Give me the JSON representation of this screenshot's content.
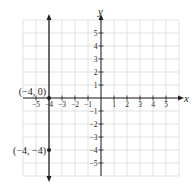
{
  "chart_data": {
    "type": "line",
    "title": "",
    "xlabel": "x",
    "ylabel": "y",
    "xlim": [
      -6,
      6
    ],
    "ylim": [
      -6,
      6
    ],
    "grid": true,
    "x_ticks": [
      -5,
      -4,
      -3,
      -2,
      -1,
      1,
      2,
      3,
      4,
      5
    ],
    "y_ticks": [
      5,
      4,
      3,
      2,
      1,
      -1,
      -2,
      -3,
      -4,
      -5
    ],
    "x_tick_labels": [
      "−5",
      "−4",
      "−3",
      "−2",
      "−1",
      "1",
      "2",
      "3",
      "4",
      "5"
    ],
    "y_tick_labels": [
      "5",
      "4",
      "3",
      "2",
      "1",
      "−1",
      "−2",
      "−3",
      "−4",
      "−5"
    ],
    "series": [
      {
        "name": "x = -4",
        "kind": "vertical-line",
        "x": -4,
        "arrows": "both",
        "points": [
          {
            "x": -4,
            "y": 0,
            "label": "(−4, 0)"
          },
          {
            "x": -4,
            "y": -4,
            "label": "(−4, −4)"
          }
        ]
      }
    ]
  },
  "axes": {
    "x_label": "x",
    "y_label": "y"
  },
  "colors": {
    "grid": "#d9d9d9",
    "axis": "#231f20",
    "line": "#231f20"
  }
}
